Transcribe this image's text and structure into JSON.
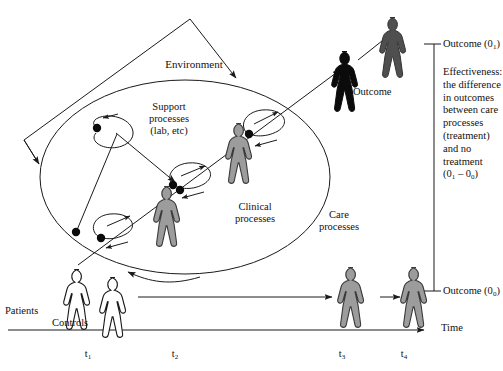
{
  "figure": {
    "background": "#ffffff",
    "line_color": "#1a1a1a",
    "colors": {
      "outline_figure_fill": "#ffffff",
      "gray_figure_fill": "#9c9c9c",
      "dark_figure_fill": "#4f4f4f",
      "black_figure_fill": "#0b0b0b",
      "stroke": "#1a1a1a",
      "dot": "#0b0b0b"
    }
  },
  "labels": {
    "environment": "Environment",
    "support_processes": "Support\nprocesses\n(lab, etc)",
    "support_processes_lines": [
      "Support",
      "processes",
      "(lab, etc)"
    ],
    "clinical_processes_lines": [
      "Clinical",
      "processes"
    ],
    "care_processes_lines": [
      "Care",
      "processes"
    ],
    "outcome": "Outcome",
    "patients": "Patients",
    "controls": "Controls",
    "time": "Time"
  },
  "right_panel": {
    "outcome_1": {
      "text": "Outcome (0",
      "sub": "1",
      "close": ")"
    },
    "outcome_0": {
      "text": "Outcome (0",
      "sub": "0",
      "close": ")"
    },
    "effectiveness_lines": [
      "Effectiveness:",
      "the difference",
      "in outcomes",
      "between care",
      "processes",
      "(treatment)",
      "and no",
      "treatment"
    ],
    "effectiveness_formula": {
      "prefix": "(0",
      "sub1": "1",
      "middle": " – 0",
      "sub2": "0",
      "suffix": ")"
    }
  },
  "time_axis": {
    "label": "Time",
    "ticks": [
      {
        "base": "t",
        "sub": "1",
        "x": 88
      },
      {
        "base": "t",
        "sub": "2",
        "x": 175
      },
      {
        "base": "t",
        "sub": "3",
        "x": 342
      },
      {
        "base": "t",
        "sub": "4",
        "x": 404
      }
    ]
  },
  "people": [
    {
      "name": "patient-figure",
      "role": "Patients",
      "shade": "outline",
      "x": 62,
      "y": 268,
      "h": 62
    },
    {
      "name": "control-figure",
      "role": "Controls",
      "shade": "outline",
      "x": 98,
      "y": 276,
      "h": 62
    },
    {
      "name": "treated-figure-t2a",
      "role": "treated",
      "shade": "gray",
      "x": 159,
      "y": 185,
      "h": 62
    },
    {
      "name": "treated-figure-t2b",
      "role": "treated",
      "shade": "gray",
      "x": 233,
      "y": 122,
      "h": 62
    },
    {
      "name": "outcome-figure-dark",
      "role": "outcome-intermediate",
      "shade": "black",
      "x": 337,
      "y": 52,
      "h": 58
    },
    {
      "name": "outcome-figure-final",
      "role": "outcome-final",
      "shade": "dark",
      "x": 386,
      "y": 18,
      "h": 58
    },
    {
      "name": "control-outcome-figure-t3",
      "role": "control-outcome",
      "shade": "gray",
      "x": 344,
      "y": 268,
      "h": 58
    },
    {
      "name": "control-outcome-figure-t4",
      "role": "control-outcome",
      "shade": "gray",
      "x": 407,
      "y": 268,
      "h": 58
    }
  ],
  "process_loops": [
    {
      "name": "support-loop-upper",
      "cx": 107,
      "cy": 133
    },
    {
      "name": "process-loop-lower-left",
      "cx": 110,
      "cy": 228
    },
    {
      "name": "process-loop-middle",
      "cx": 185,
      "cy": 177
    },
    {
      "name": "process-loop-upper-right",
      "cx": 258,
      "cy": 125
    }
  ],
  "dots": [
    {
      "name": "process-node",
      "x": 97,
      "y": 128
    },
    {
      "name": "process-node",
      "x": 76,
      "y": 232
    },
    {
      "name": "process-node",
      "x": 101,
      "y": 238
    },
    {
      "name": "process-node",
      "x": 173,
      "y": 185
    },
    {
      "name": "process-node",
      "x": 179,
      "y": 190
    },
    {
      "name": "process-node",
      "x": 248,
      "y": 134
    }
  ]
}
